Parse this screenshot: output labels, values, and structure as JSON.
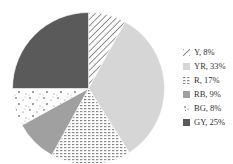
{
  "chart_data": {
    "type": "pie",
    "title": "",
    "start_angle": "12 o'clock",
    "direction": "clockwise",
    "categories": [
      "Y",
      "YR",
      "R",
      "RB",
      "BG",
      "GY"
    ],
    "values": [
      8,
      33,
      17,
      9,
      8,
      25
    ],
    "unit": "%",
    "slices": [
      {
        "label": "Y",
        "value": 8,
        "pattern": "diagonal-hatch",
        "color": "#555555"
      },
      {
        "label": "YR",
        "value": 33,
        "pattern": "solid",
        "color": "#d6d6d6"
      },
      {
        "label": "R",
        "value": 17,
        "pattern": "fine-dash",
        "color": "#9a9a9a"
      },
      {
        "label": "RB",
        "value": 9,
        "pattern": "solid",
        "color": "#a0a0a0"
      },
      {
        "label": "BG",
        "value": 8,
        "pattern": "sparse-dots",
        "color": "#222222"
      },
      {
        "label": "GY",
        "value": 25,
        "pattern": "solid",
        "color": "#5a5a5a"
      }
    ],
    "legend_position": "right"
  },
  "legend": {
    "items": [
      {
        "text": "Y, 8%"
      },
      {
        "text": "YR, 33%"
      },
      {
        "text": "R, 17%"
      },
      {
        "text": "RB, 9%"
      },
      {
        "text": "BG, 8%"
      },
      {
        "text": "GY, 25%"
      }
    ]
  }
}
